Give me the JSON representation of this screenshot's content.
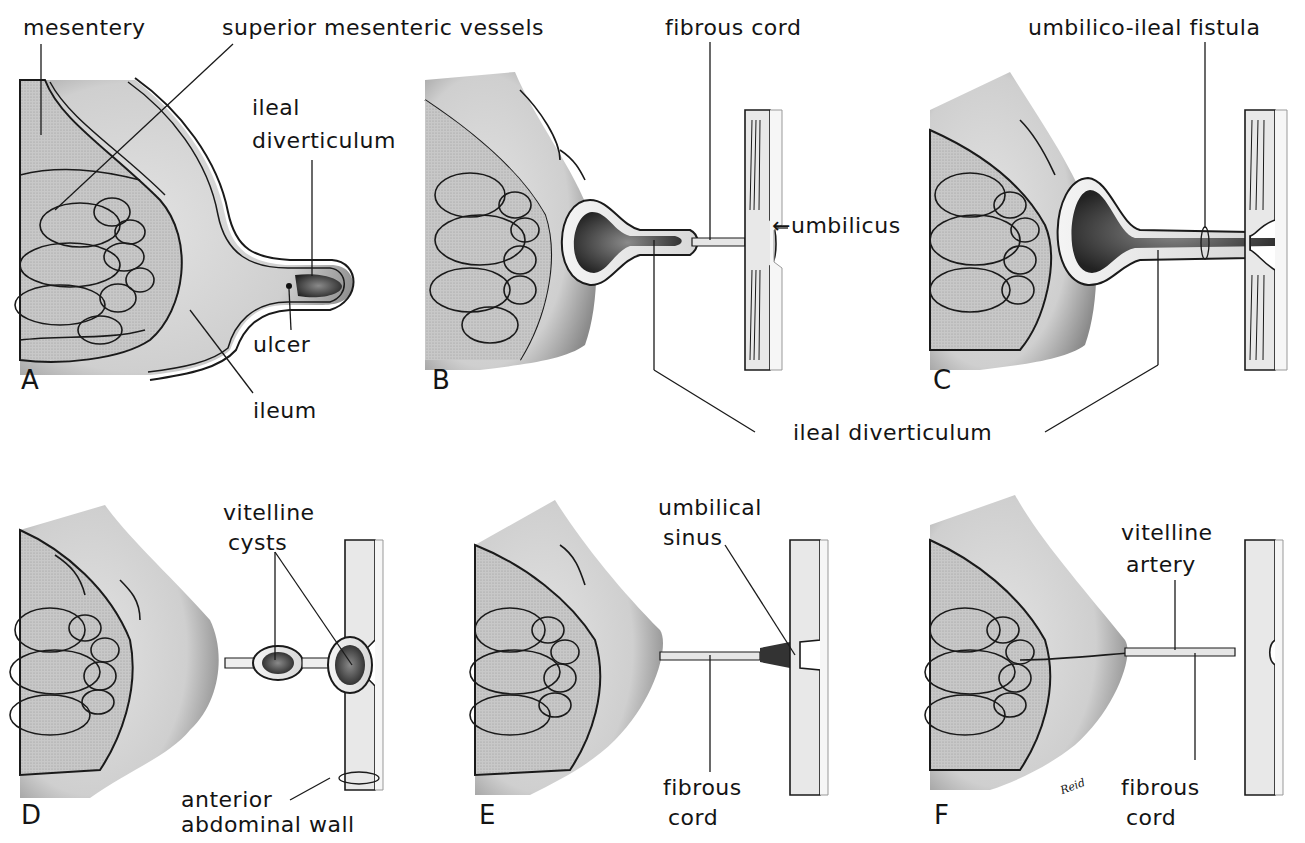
{
  "figure": {
    "artist_signature": "Reid",
    "colors": {
      "tissue_gray": "#d4d4d4",
      "mesentery_gray": "#bdbdbd",
      "lumen_dark": "#3a3a3a",
      "outline": "#1a1a1a",
      "wall_pale": "#eeeeee"
    },
    "panels": [
      {
        "letter": "A",
        "labels": {
          "mesentery": "mesentery",
          "superior_mesenteric_vessels": "superior mesenteric vessels",
          "ileal_diverticulum_l1": "ileal",
          "ileal_diverticulum_l2": "diverticulum",
          "ulcer": "ulcer",
          "ileum": "ileum"
        }
      },
      {
        "letter": "B",
        "labels": {
          "fibrous_cord": "fibrous cord",
          "umbilicus": "←umbilicus"
        }
      },
      {
        "letter": "C",
        "labels": {
          "umbilico_ileal_fistula": "umbilico-ileal fistula"
        }
      },
      {
        "shared_label": "ileal diverticulum"
      },
      {
        "letter": "D",
        "labels": {
          "vitelline_cysts_l1": "vitelline",
          "vitelline_cysts_l2": "cysts",
          "anterior_abdominal_wall_l1": "anterior",
          "anterior_abdominal_wall_l2": "abdominal wall"
        }
      },
      {
        "letter": "E",
        "labels": {
          "umbilical_sinus_l1": "umbilical",
          "umbilical_sinus_l2": "sinus",
          "fibrous_cord_l1": "fibrous",
          "fibrous_cord_l2": "cord"
        }
      },
      {
        "letter": "F",
        "labels": {
          "vitelline_artery_l1": "vitelline",
          "vitelline_artery_l2": "artery",
          "fibrous_cord_l1": "fibrous",
          "fibrous_cord_l2": "cord"
        }
      }
    ]
  }
}
